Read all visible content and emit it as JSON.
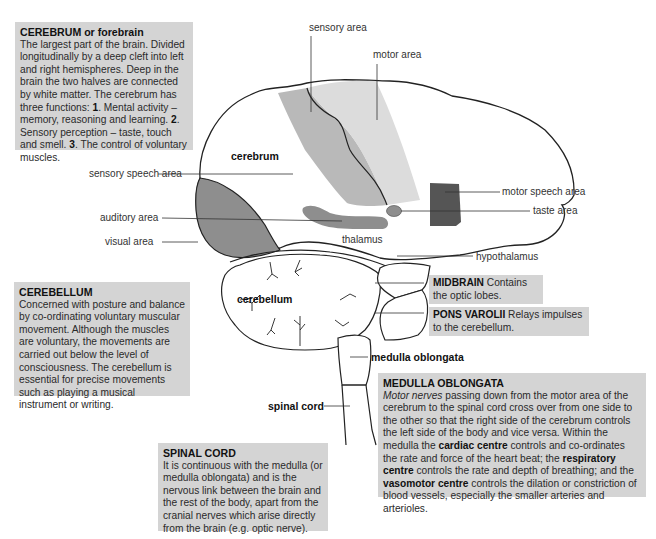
{
  "colors": {
    "box_bg": "#d4d4d4",
    "sensory_area": "#b9b9b9",
    "motor_area": "#dcdcdc",
    "visual_area": "#8e8e8e",
    "thalamus_shape": "#8e8e8e",
    "motor_speech_area": "#555555",
    "taste_area": "#8e8e8e",
    "outline": "#222222"
  },
  "boxes": {
    "cerebrum": {
      "title": "CEREBRUM or forebrain",
      "text_a": "The largest part of the brain. Divided longitudinally by a deep cleft into left and right hemispheres. Deep in the brain the two halves are connected by white matter. The cerebrum has three functions: ",
      "n1": "1",
      "text_b": ". Mental activity – memory, reasoning and learning. ",
      "n2": "2",
      "text_c": ". Sensory perception – taste, touch and smell. ",
      "n3": "3",
      "text_d": ". The control of voluntary muscles."
    },
    "cerebellum": {
      "title": "CEREBELLUM",
      "text": "Concerned with posture and balance by co-ordinating voluntary muscular movement. Although the muscles are voluntary, the movements are carried out below the level of consciousness. The cerebellum is essential for precise movements such as playing a musical instrument or writing."
    },
    "midbrain": {
      "title": "MIDBRAIN",
      "text": " Contains the optic lobes."
    },
    "pons": {
      "title": "PONS VAROLII",
      "text": " Relays impulses to the cerebellum."
    },
    "medulla": {
      "title": "MEDULLA OBLONGATA",
      "italic": "Motor nerves",
      "text_a": " passing down from the motor area of the cerebrum to the spinal cord cross over from one side to the other so that the right side of the cerebrum controls the left side of the body and vice versa. Within the medulla the ",
      "b1": "cardiac centre",
      "text_b": " controls and co-ordinates the rate and force of the heart beat; the ",
      "b2": "respiratory centre",
      "text_c": " controls the rate and depth of breathing; and the ",
      "b3": "vasomotor centre",
      "text_d": " controls the dilation or constriction of blood vessels, especially the smaller arteries and arterioles."
    },
    "spinal": {
      "title": "SPINAL CORD",
      "text": "It is continuous with the medulla (or medulla oblongata) and is the nervous link between the brain and the rest of the body, apart from the cranial nerves which arise directly from the brain (e.g. optic nerve)."
    }
  },
  "labels": {
    "sensory_area": "sensory area",
    "motor_area": "motor area",
    "cerebrum": "cerebrum",
    "sensory_speech_area": "sensory speech area",
    "auditory_area": "auditory area",
    "visual_area": "visual area",
    "thalamus": "thalamus",
    "motor_speech_area": "motor speech area",
    "taste_area": "taste area",
    "hypothalamus": "hypothalamus",
    "cerebellum": "cerebellum",
    "medulla_oblongata": "medulla oblongata",
    "spinal_cord": "spinal cord"
  }
}
